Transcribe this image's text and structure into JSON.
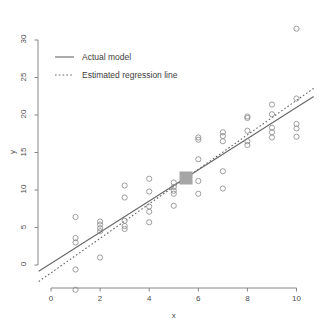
{
  "chart_data": {
    "type": "scatter",
    "title": "",
    "subtitle": "",
    "xlabel": "x",
    "ylabel": "y",
    "xlim": [
      -0.5,
      10.7
    ],
    "ylim": [
      -3.8,
      32.8
    ],
    "xticks": [
      0,
      2,
      4,
      6,
      8,
      10
    ],
    "xtick_labels": [
      "0",
      "2",
      "4",
      "6",
      "8",
      "10"
    ],
    "yticks": [
      0,
      5,
      10,
      15,
      20,
      25,
      30
    ],
    "ytick_labels": [
      "0",
      "5",
      "10",
      "15",
      "20",
      "25",
      "30"
    ],
    "grid": false,
    "legend_position": "top-left",
    "legend": [
      {
        "label": "Actual model",
        "style": "solid",
        "color": "#666666"
      },
      {
        "label": "Estimated regression line",
        "style": "dotted",
        "color": "#666666"
      }
    ],
    "point_marker": "open-circle",
    "point_color": "#8c8c8c",
    "points": [
      {
        "x": 1,
        "y": 6.4
      },
      {
        "x": 1,
        "y": 3.6
      },
      {
        "x": 1,
        "y": 3.0
      },
      {
        "x": 1,
        "y": -0.6
      },
      {
        "x": 1,
        "y": -3.3
      },
      {
        "x": 2,
        "y": 5.8
      },
      {
        "x": 2,
        "y": 5.4
      },
      {
        "x": 2,
        "y": 4.9
      },
      {
        "x": 2,
        "y": 4.5
      },
      {
        "x": 2,
        "y": 1.0
      },
      {
        "x": 3,
        "y": 10.6
      },
      {
        "x": 3,
        "y": 9.0
      },
      {
        "x": 3,
        "y": 5.9
      },
      {
        "x": 3,
        "y": 5.2
      },
      {
        "x": 3,
        "y": 4.8
      },
      {
        "x": 4,
        "y": 11.5
      },
      {
        "x": 4,
        "y": 9.8
      },
      {
        "x": 4,
        "y": 7.8
      },
      {
        "x": 4,
        "y": 7.1
      },
      {
        "x": 4,
        "y": 5.7
      },
      {
        "x": 5,
        "y": 11.0
      },
      {
        "x": 5,
        "y": 10.4
      },
      {
        "x": 5,
        "y": 9.9
      },
      {
        "x": 5,
        "y": 9.5
      },
      {
        "x": 5,
        "y": 7.9
      },
      {
        "x": 6,
        "y": 17.0
      },
      {
        "x": 6,
        "y": 16.7
      },
      {
        "x": 6,
        "y": 14.1
      },
      {
        "x": 6,
        "y": 11.2
      },
      {
        "x": 6,
        "y": 9.5
      },
      {
        "x": 7,
        "y": 17.7
      },
      {
        "x": 7,
        "y": 17.2
      },
      {
        "x": 7,
        "y": 16.5
      },
      {
        "x": 7,
        "y": 12.5
      },
      {
        "x": 7,
        "y": 10.2
      },
      {
        "x": 8,
        "y": 19.8
      },
      {
        "x": 8,
        "y": 19.6
      },
      {
        "x": 8,
        "y": 17.9
      },
      {
        "x": 8,
        "y": 16.5
      },
      {
        "x": 8,
        "y": 16.0
      },
      {
        "x": 9,
        "y": 21.4
      },
      {
        "x": 9,
        "y": 20.1
      },
      {
        "x": 9,
        "y": 18.3
      },
      {
        "x": 9,
        "y": 17.7
      },
      {
        "x": 9,
        "y": 17.0
      },
      {
        "x": 10,
        "y": 31.5
      },
      {
        "x": 10,
        "y": 22.2
      },
      {
        "x": 10,
        "y": 18.8
      },
      {
        "x": 10,
        "y": 18.2
      },
      {
        "x": 10,
        "y": 17.1
      }
    ],
    "centroid": {
      "x": 5.5,
      "y": 11.6,
      "marker": "filled-square",
      "color": "#a6a6a6"
    },
    "actual_model": {
      "intercept": 0.2,
      "slope": 2.08,
      "style": "solid",
      "color": "#666666"
    },
    "estimated_regression_line": {
      "intercept": -1.05,
      "slope": 2.3,
      "style": "dotted",
      "color": "#666666"
    }
  }
}
